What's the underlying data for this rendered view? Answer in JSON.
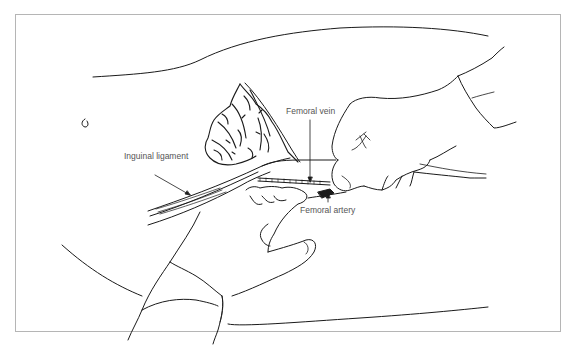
{
  "figure": {
    "colors": {
      "line": "#1a1a1a",
      "label_text": "#555555",
      "frame": "#b5b5b5",
      "background": "#ffffff"
    },
    "labels": [
      {
        "id": "inguinal-ligament",
        "text": "Inguinal ligament"
      },
      {
        "id": "femoral-vein",
        "text": "Femoral vein"
      },
      {
        "id": "femoral-artery",
        "text": "Femoral artery"
      }
    ]
  }
}
